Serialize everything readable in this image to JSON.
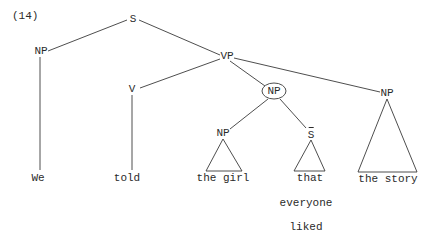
{
  "example_number": "(14)",
  "nodes": {
    "s": "S",
    "np_subject": "NP",
    "vp": "VP",
    "v": "V",
    "np_circled": "NP",
    "np_object2": "NP",
    "np_inner": "NP",
    "sbar": "S"
  },
  "leaves": {
    "we": "We",
    "told": "told",
    "the_girl": "the girl",
    "that": "that",
    "the_story": "the story",
    "everyone": "everyone",
    "liked": "liked"
  },
  "annotations": {
    "circled_node": "np_circled",
    "sbar_has_overbar": true
  }
}
